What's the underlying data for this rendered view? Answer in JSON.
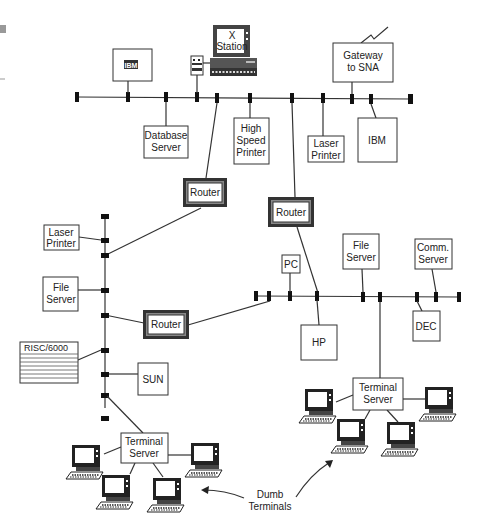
{
  "diagram": {
    "type": "network-topology",
    "segments": {
      "top_backbone": {
        "nodes": [
          {
            "id": "ibm-top-left",
            "label": "IBM"
          },
          {
            "id": "database-server",
            "label": "Database\nServer"
          },
          {
            "id": "x-station",
            "label": "X\nStation"
          },
          {
            "id": "high-speed-printer",
            "label": "High\nSpeed\nPrinter"
          },
          {
            "id": "laser-printer-top",
            "label": "Laser\nPrinter"
          },
          {
            "id": "gateway-sna",
            "label": "Gateway\nto SNA"
          },
          {
            "id": "ibm-top-right",
            "label": "IBM"
          }
        ]
      },
      "left_segment": {
        "nodes": [
          {
            "id": "laser-printer-left",
            "label": "Laser\nPrinter"
          },
          {
            "id": "file-server-left",
            "label": "File\nServer"
          },
          {
            "id": "risc6000",
            "label": "RISC/6000"
          },
          {
            "id": "sun",
            "label": "SUN"
          },
          {
            "id": "terminal-server-left",
            "label": "Terminal\nServer"
          }
        ]
      },
      "right_segment": {
        "nodes": [
          {
            "id": "pc",
            "label": "PC"
          },
          {
            "id": "hp",
            "label": "HP"
          },
          {
            "id": "file-server-right",
            "label": "File\nServer"
          },
          {
            "id": "comm-server",
            "label": "Comm.\nServer"
          },
          {
            "id": "dec",
            "label": "DEC"
          },
          {
            "id": "terminal-server-right",
            "label": "Terminal\nServer"
          }
        ]
      }
    },
    "routers": [
      {
        "id": "router-1",
        "label": "Router"
      },
      {
        "id": "router-2",
        "label": "Router"
      },
      {
        "id": "router-3",
        "label": "Router"
      }
    ],
    "annotation": {
      "label_line1": "Dumb",
      "label_line2": "Terminals"
    }
  },
  "labels": {
    "ibm_logo": "IBM",
    "x_station_1": "X",
    "x_station_2": "Station",
    "gateway_1": "Gateway",
    "gateway_2": "to SNA",
    "db_1": "Database",
    "db_2": "Server",
    "hsp_1": "High",
    "hsp_2": "Speed",
    "hsp_3": "Printer",
    "lp_1": "Laser",
    "lp_2": "Printer",
    "ibm": "IBM",
    "router": "Router",
    "fs_1": "File",
    "fs_2": "Server",
    "risc": "RISC/6000",
    "sun": "SUN",
    "pc": "PC",
    "hp": "HP",
    "comm_1": "Comm.",
    "comm_2": "Server",
    "dec": "DEC",
    "ts_1": "Terminal",
    "ts_2": "Server",
    "dumb_1": "Dumb",
    "dumb_2": "Terminals"
  }
}
